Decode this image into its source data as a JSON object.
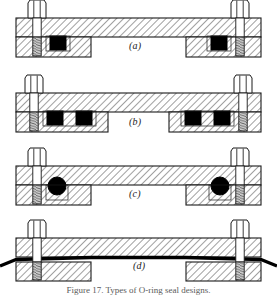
{
  "figure": {
    "caption": "Figure 17.  Types of O-ring seal designs.",
    "panel_count": 4,
    "colors": {
      "outline": "#1a1a1a",
      "hatch": "#2b2b2b",
      "seal_black": "#000000",
      "thread_gray": "#8a8a8a",
      "background": "#ffffff",
      "label_text": "#1a1a1a"
    },
    "panels": [
      {
        "id": "a",
        "label": "(a)",
        "seal_type": "square-section gasket",
        "seal_shape": "square",
        "seal_count": 2,
        "seal_side": "inboard of bolt",
        "bolt_count": 2,
        "description": "Upper flange plate bolted to lower flange with a single square-section seal element adjacent to each bolt, located toward the joint interior."
      },
      {
        "id": "b",
        "label": "(b)",
        "seal_type": "double square-section gasket",
        "seal_shape": "square",
        "seal_count": 4,
        "seal_side": "two per bolt, inboard",
        "bolt_count": 2,
        "description": "Same bolted flange arrangement with two square-section seal elements inboard of each bolt, forming a redundant double seal."
      },
      {
        "id": "c",
        "label": "(c)",
        "seal_type": "O-ring (round section)",
        "seal_shape": "circle",
        "seal_count": 2,
        "seal_side": "inboard of bolt",
        "bolt_count": 2,
        "description": "Circular cross-section O-ring seated in a groove inboard of each bolt between the upper and lower flange plates."
      },
      {
        "id": "d",
        "label": "(d)",
        "seal_type": "continuous thin sheet gasket",
        "seal_shape": "strip",
        "seal_count": 1,
        "seal_side": "full-face, extends beyond flange edges",
        "bolt_count": 2,
        "description": "A single thin continuous gasket sheet clamped across the entire flange face, protruding outward past both flange edges and passing under the bolts."
      }
    ],
    "common_elements": [
      {
        "name": "hex-head-bolt",
        "count_per_panel": 2,
        "position": "left and right ends"
      },
      {
        "name": "threaded-shank",
        "count_per_panel": 2,
        "render": "horizontal thread ticks"
      },
      {
        "name": "upper-flange-plate",
        "count_per_panel": 1,
        "render": "45-degree section hatching"
      },
      {
        "name": "lower-flange-plate",
        "count_per_panel": 2,
        "render": "45-degree section hatching"
      }
    ]
  }
}
